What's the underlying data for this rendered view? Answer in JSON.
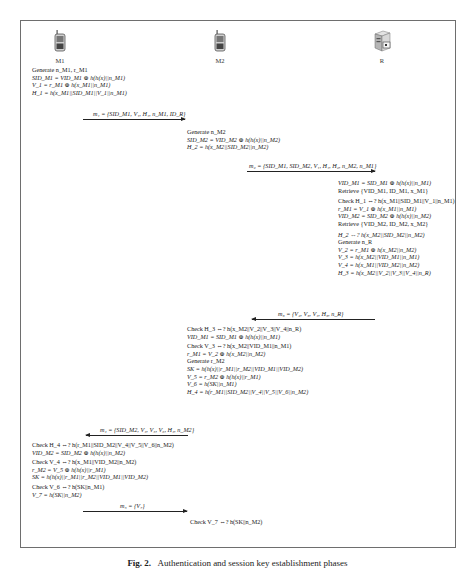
{
  "entities": {
    "m1": {
      "label": "M1",
      "icon": "mobile-phone-icon"
    },
    "m2": {
      "label": "M2",
      "icon": "mobile-phone-icon"
    },
    "r": {
      "label": "R",
      "icon": "server-icon"
    }
  },
  "m1_block1": [
    "Generate n_M1, r_M1",
    "SID_M1 = VID_M1 ⊕ h(h(x)||n_M1)",
    "V_1 = r_M1 ⊕ h(x_M1||n_M1)",
    "H_1 = h(x_M1||SID_M1||V_1||n_M1)"
  ],
  "messages": {
    "m1": {
      "label": "m₁ = {SID_M1, V₁, H₁, n_M1, ID_R}",
      "direction": "M1→M2"
    },
    "m2": {
      "label": "m₂ = {SID_M1, SID_M2, V₁, H₁, H₂, n_M2, n_M1}",
      "direction": "M2→R"
    },
    "m3": {
      "label": "m₃ = {V₂, V₃, V₄, H₃, n_R}",
      "direction": "R→M2"
    },
    "m4": {
      "label": "m₄ = {SID_M2, V₄, V₅, V₆, H₄, n_M2}",
      "direction": "M2→M1"
    },
    "m5": {
      "label": "m₅ = {V₇}",
      "direction": "M1→M2"
    }
  },
  "m2_block1": [
    "Generate n_M2",
    "SID_M2 = VID_M2 ⊕ h(h(x)||n_M2)",
    "H_2 = h(x_M2||SID_M2||n_M2)"
  ],
  "r_block": [
    "VID_M1 = SID_M1 ⊕ h(h(x)||n_M1)",
    "Retrieve {VID_M1, ID_M1, x_M1}",
    "Check H_1 ⇔? h(x_M1||SID_M1||V_1||n_M1)",
    "r_M1 = V_1 ⊕ h(x_M1||n_M1)",
    "VID_M2 = SID_M2 ⊕ h(h(x)||n_M2)",
    "Retrieve {VID_M2, ID_M2, x_M2}",
    "H_2 ⇔? h(x_M2||SID_M2||n_M2)",
    "Generate n_R",
    "V_2 = r_M1 ⊕ h(x_M2||n_M2)",
    "V_3 = h(x_M2||VID_M1||n_M1)",
    "V_4 = h(x_M1||VID_M2||n_M2)",
    "H_3 = h(x_M2||V_2||V_3||V_4||n_R)"
  ],
  "m2_block2": [
    "Check H_3 ⇔? h(x_M2||V_2||V_3||V_4||n_R)",
    "VID_M1 = SID_M1 ⊕ h(h(x)||n_M1)",
    "Check V_3 ⇔? h(x_M2||VID_M1||n_M1)",
    "r_M1 = V_2 ⊕ h(x_M2||n_M2)",
    "Generate r_M2",
    "SK = h(h(x)||r_M1||r_M2||VID_M1||VID_M2)",
    "V_5 = r_M2 ⊕ h(h(x)||r_M1)",
    "V_6 = h(SK||n_M1)",
    "H_4 = h(r_M1||SID_M2||V_4||V_5||V_6||n_M2)"
  ],
  "m1_block2": [
    "Check H_4 ⇔? h(r_M1||SID_M2||V_4||V_5||V_6||n_M2)",
    "VID_M2 = SID_M2 ⊕ h(h(x)||n_M2)",
    "Check V_4 ⇔? h(x_M1||VID_M2||n_M2)",
    "r_M2 = V_5 ⊕ h(h(x)||r_M1)",
    "SK = h(h(x)||r_M1||r_M2||VID_M1||VID_M2)",
    "Check V_6 ⇔? h(SK||n_M1)",
    "V_7 = h(SK||n_M2)"
  ],
  "m2_block3": [
    "Check V_7 ⇔? h(SK||n_M2)"
  ],
  "caption": {
    "prefix": "Fig. 2.",
    "text": "Authentication and session key establishment phases"
  }
}
